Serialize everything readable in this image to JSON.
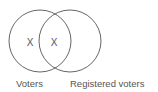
{
  "diagram": {
    "type": "venn",
    "sets": [
      {
        "name": "Voters",
        "label": "Voters",
        "mark": "X"
      },
      {
        "name": "Registered voters",
        "label": "Registered voters"
      }
    ],
    "intersection": {
      "mark": "X"
    },
    "colors": {
      "stroke": "#666666",
      "text": "#555555",
      "background": "#ffffff"
    }
  }
}
